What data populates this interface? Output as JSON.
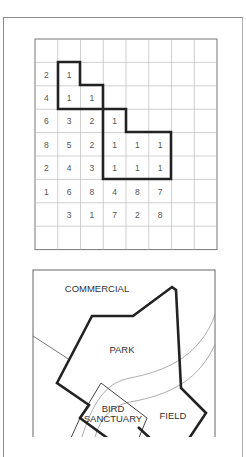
{
  "grid": {
    "columns": 8,
    "rows": 9,
    "origin": [
      35,
      39
    ],
    "cell_width": 22.75,
    "cell_height": 23.4,
    "cells": [
      [
        "",
        "",
        "",
        "",
        "",
        "",
        "",
        ""
      ],
      [
        "2",
        "1",
        "",
        "",
        "",
        "",
        "",
        ""
      ],
      [
        "4",
        "1",
        "1",
        "",
        "",
        "",
        "",
        ""
      ],
      [
        "6",
        "3",
        "2",
        "1",
        "",
        "",
        "",
        ""
      ],
      [
        "8",
        "5",
        "2",
        "1",
        "1",
        "1",
        "",
        ""
      ],
      [
        "2",
        "4",
        "3",
        "1",
        "1",
        "1",
        "",
        ""
      ],
      [
        "1",
        "6",
        "8",
        "4",
        "8",
        "7",
        "",
        ""
      ],
      [
        "",
        "3",
        "1",
        "7",
        "2",
        "8",
        "",
        ""
      ],
      [
        "",
        "",
        "",
        "",
        "",
        "",
        "",
        ""
      ]
    ],
    "highlighted_region_label": "least-cost path (cells with value 1)"
  },
  "map": {
    "labels": {
      "commercial": "COMMERCIAL",
      "park": "PARK",
      "bird_line1": "BIRD",
      "bird_line2": "SANCTUARY",
      "field": "FIELD"
    }
  }
}
